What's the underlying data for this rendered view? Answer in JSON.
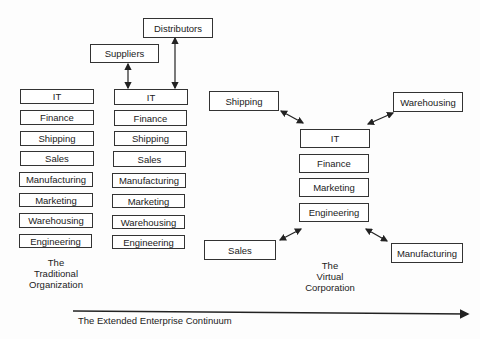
{
  "top_nodes": {
    "suppliers": "Suppliers",
    "distributors": "Distributors"
  },
  "traditional": {
    "boxes": [
      "IT",
      "Finance",
      "Shipping",
      "Sales",
      "Manufacturing",
      "Marketing",
      "Warehousing",
      "Engineering"
    ],
    "caption": [
      "The",
      "Traditional",
      "Organization"
    ]
  },
  "extended": {
    "boxes": [
      "IT",
      "Finance",
      "Shipping",
      "Sales",
      "Manufacturing",
      "Marketing",
      "Warehousing",
      "Engineering"
    ]
  },
  "virtual": {
    "core": [
      "IT",
      "Finance",
      "Marketing",
      "Engineering"
    ],
    "satellites": {
      "shipping": "Shipping",
      "warehousing": "Warehousing",
      "sales": "Sales",
      "manufacturing": "Manufacturing"
    },
    "caption": [
      "The",
      "Virtual",
      "Corporation"
    ]
  },
  "continuum": {
    "label": "The Extended Enterprise Continuum"
  }
}
